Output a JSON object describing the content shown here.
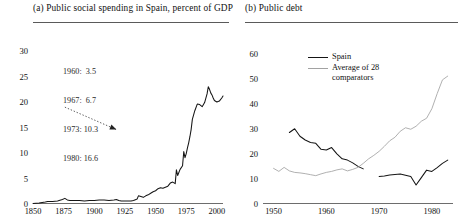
{
  "figure": {
    "panels": [
      {
        "tag": "(a)",
        "title": "(a) Public social spending in Spain, percent of GDP",
        "annotation": {
          "lines": [
            "1960:  3.5",
            "1967:  6.7",
            "1973: 10.3",
            "1980: 16.6"
          ],
          "rows": [
            {
              "year": "1960:",
              "value": "3.5"
            },
            {
              "year": "1967:",
              "value": "6.7"
            },
            {
              "year": "1973:",
              "value": "10.3"
            },
            {
              "year": "1980:",
              "value": "16.6"
            }
          ]
        }
      },
      {
        "tag": "(b)",
        "title": "(b) Public debt",
        "legend": {
          "spain": "Spain",
          "average_line1": "Average of 28",
          "average_line2": "comparators"
        }
      }
    ]
  },
  "colors": {
    "spain_line": "#151515",
    "average_line": "#a2a2a2",
    "axis": "#6d6d6d",
    "rule": "#5a5a5a",
    "text": "#111111",
    "annotation_text": "#2a2a2a"
  },
  "chart_data": [
    {
      "type": "line",
      "title": "(a) Public social spending in Spain, percent of GDP",
      "xlabel": "",
      "ylabel": "",
      "xlim": [
        1850,
        2005
      ],
      "ylim": [
        0,
        31
      ],
      "xticks": [
        1850,
        1875,
        1900,
        1925,
        1950,
        1975,
        2000
      ],
      "yticks": [
        0,
        5,
        10,
        15,
        20,
        25,
        30
      ],
      "grid": false,
      "legend": "none",
      "annotations": [
        {
          "text": "1960:  3.5",
          "x": 1878,
          "y": 27.3
        },
        {
          "text": "1967:  6.7",
          "x": 1878,
          "y": 25.4
        },
        {
          "text": "1973: 10.3",
          "x": 1878,
          "y": 23.5
        },
        {
          "text": "1980: 16.6",
          "x": 1878,
          "y": 21.6
        },
        {
          "type": "dotted-arrow",
          "from_x": 1876,
          "from_y": 19.0,
          "to_x": 1918,
          "to_y": 14.6
        }
      ],
      "series": [
        {
          "name": "Public social spending (% of GDP)",
          "color": "#151515",
          "x": [
            1850,
            1855,
            1860,
            1862,
            1866,
            1870,
            1874,
            1876,
            1878,
            1880,
            1884,
            1888,
            1892,
            1896,
            1900,
            1904,
            1908,
            1912,
            1916,
            1918,
            1920,
            1922,
            1930,
            1932,
            1934,
            1935,
            1936,
            1940,
            1942,
            1944,
            1946,
            1948,
            1950,
            1952,
            1954,
            1956,
            1958,
            1960,
            1962,
            1964,
            1966,
            1967,
            1968,
            1970,
            1972,
            1973,
            1974,
            1975,
            1976,
            1977,
            1978,
            1979,
            1980,
            1982,
            1984,
            1986,
            1988,
            1990,
            1992,
            1993,
            1994,
            1995,
            1996,
            1997,
            1998,
            2000,
            2002,
            2004,
            2005
          ],
          "y": [
            0.1,
            0.2,
            0.4,
            0.5,
            0.5,
            0.6,
            0.9,
            1.1,
            0.8,
            0.7,
            0.7,
            0.7,
            0.6,
            0.7,
            0.7,
            0.8,
            0.8,
            0.7,
            0.8,
            0.9,
            0.7,
            0.6,
            0.6,
            0.7,
            0.9,
            1.0,
            1.6,
            1.3,
            1.6,
            1.8,
            2.1,
            2.4,
            2.6,
            3.0,
            3.2,
            3.1,
            3.3,
            3.5,
            4.1,
            4.3,
            4.0,
            6.7,
            5.6,
            6.8,
            7.5,
            10.3,
            9.1,
            9.9,
            11.0,
            12.0,
            13.2,
            14.6,
            16.6,
            18.3,
            19.6,
            19.5,
            19.1,
            19.9,
            21.6,
            23.0,
            22.5,
            21.8,
            21.4,
            20.8,
            20.3,
            20.0,
            20.2,
            20.8,
            21.2
          ]
        }
      ]
    },
    {
      "type": "line",
      "title": "(b) Public debt",
      "xlabel": "",
      "ylabel": "",
      "xlim": [
        1948,
        1984
      ],
      "ylim": [
        0,
        63
      ],
      "xticks": [
        1950,
        1960,
        1970,
        1980
      ],
      "yticks": [
        0,
        10,
        20,
        30,
        40,
        50,
        60
      ],
      "grid": false,
      "legend": "top-left-inside",
      "series": [
        {
          "name": "Spain",
          "color": "#151515",
          "segments": [
            {
              "x": [
                1953,
                1954,
                1955,
                1956,
                1957,
                1958,
                1959,
                1960,
                1961,
                1962,
                1963,
                1964,
                1965,
                1966,
                1967
              ],
              "y": [
                28.5,
                30.0,
                27.0,
                25.5,
                24.5,
                24.2,
                21.8,
                21.5,
                22.5,
                20.0,
                18.0,
                17.5,
                16.4,
                15.0,
                14.0
              ]
            },
            {
              "x": [
                1970,
                1971,
                1972,
                1973,
                1974,
                1975,
                1976,
                1977,
                1978,
                1979,
                1980,
                1981,
                1982,
                1983
              ],
              "y": [
                11.0,
                11.2,
                11.6,
                11.8,
                12.0,
                11.5,
                11.0,
                7.6,
                10.5,
                13.5,
                13.0,
                14.5,
                16.2,
                17.5
              ]
            }
          ]
        },
        {
          "name": "Average of 28 comparators",
          "color": "#a2a2a2",
          "x": [
            1950,
            1951,
            1952,
            1953,
            1954,
            1955,
            1956,
            1957,
            1958,
            1959,
            1960,
            1961,
            1962,
            1963,
            1964,
            1965,
            1966,
            1967,
            1968,
            1969,
            1970,
            1971,
            1972,
            1973,
            1974,
            1975,
            1976,
            1977,
            1978,
            1979,
            1980,
            1981,
            1982,
            1983
          ],
          "y": [
            14.2,
            13.0,
            14.6,
            13.2,
            12.6,
            12.4,
            12.1,
            11.7,
            11.3,
            12.0,
            12.6,
            13.0,
            13.6,
            14.0,
            13.2,
            13.8,
            14.6,
            16.2,
            18.0,
            19.4,
            21.0,
            23.0,
            25.2,
            26.6,
            29.0,
            30.4,
            29.8,
            31.0,
            33.0,
            34.2,
            38.0,
            44.0,
            49.5,
            51.0
          ]
        }
      ]
    }
  ]
}
